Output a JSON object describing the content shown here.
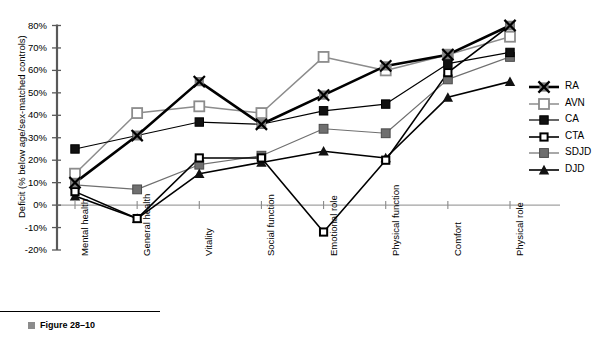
{
  "figure": {
    "caption": "Figure 28–10",
    "bullet_icon": "square-bullet-icon"
  },
  "chart_data": {
    "type": "line",
    "title": "",
    "xlabel": "",
    "ylabel": "Deficit (% below age/sex-matched controls)",
    "categories": [
      "Mental health",
      "General health",
      "Vitality",
      "Social function",
      "Emotional role",
      "Physical function",
      "Comfort",
      "Physical role"
    ],
    "ylim": [
      -20,
      80
    ],
    "yticks": [
      "-20%",
      "-10%",
      "0%",
      "10%",
      "20%",
      "30%",
      "40%",
      "50%",
      "60%",
      "70%",
      "80%"
    ],
    "ytick_values": [
      -20,
      -10,
      0,
      10,
      20,
      30,
      40,
      50,
      60,
      70,
      80
    ],
    "grid": false,
    "legend_position": "right",
    "series": [
      {
        "name": "RA",
        "marker": "x-square",
        "color": "#000000",
        "line_width": 2.6,
        "values": [
          10,
          31,
          55,
          36,
          49,
          62,
          67,
          80
        ]
      },
      {
        "name": "AVN",
        "marker": "open-square",
        "color": "#8c8c8c",
        "line_width": 1.5,
        "values": [
          14,
          41,
          44,
          41,
          66,
          60,
          67,
          75
        ]
      },
      {
        "name": "CA",
        "marker": "filled-square",
        "color": "#000000",
        "line_width": 1.2,
        "values": [
          25,
          31,
          37,
          36,
          42,
          45,
          63,
          68
        ]
      },
      {
        "name": "CTA",
        "marker": "open-square-sm",
        "color": "#000000",
        "line_width": 1.6,
        "values": [
          6,
          -6,
          21,
          21,
          -12,
          20,
          59,
          80
        ]
      },
      {
        "name": "SDJD",
        "marker": "gray-square",
        "color": "#6f6f6f",
        "line_width": 1.2,
        "values": [
          9,
          7,
          18,
          22,
          34,
          32,
          56,
          66
        ]
      },
      {
        "name": "DJD",
        "marker": "triangle",
        "color": "#000000",
        "line_width": 1.6,
        "values": [
          4,
          -6,
          14,
          19,
          24,
          21,
          48,
          55
        ]
      }
    ]
  },
  "legend": {
    "items": [
      {
        "label": "RA"
      },
      {
        "label": "AVN"
      },
      {
        "label": "CA"
      },
      {
        "label": "CTA"
      },
      {
        "label": "SDJD"
      },
      {
        "label": "DJD"
      }
    ]
  }
}
